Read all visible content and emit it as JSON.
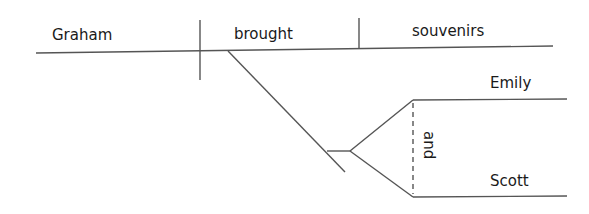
{
  "diagram": {
    "type": "sentence-diagram",
    "sentence": "Graham brought souvenirs for Emily and Scott",
    "subject": "Graham",
    "verb": "brought",
    "direct_object": "souvenirs",
    "compound_object": {
      "upper": "Emily",
      "conjunction": "and",
      "lower": "Scott"
    },
    "line_color": "#555555",
    "text_color": "#1a1a1a"
  }
}
